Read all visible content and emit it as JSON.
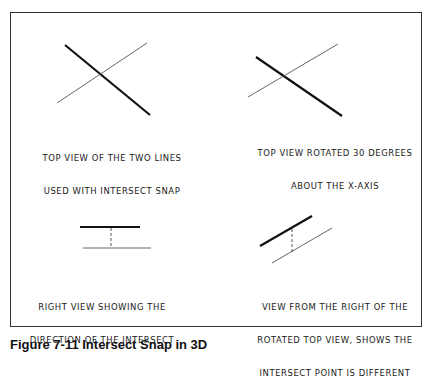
{
  "figure": {
    "caption": "Figure 7-11 Intersect Snap in 3D",
    "panels": [
      {
        "id": "top-view",
        "label_lines": [
          "TOP VIEW OF THE TWO LINES",
          "USED WITH INTERSECT SNAP"
        ],
        "thick_line": [
          65,
          45,
          150,
          115
        ],
        "thin_line": [
          57,
          103,
          147,
          43
        ]
      },
      {
        "id": "rotated-top-view",
        "label_lines": [
          "TOP VIEW ROTATED 30 DEGREES",
          "ABOUT THE X-AXIS"
        ],
        "thick_line": [
          256,
          57,
          342,
          116
        ],
        "thin_line": [
          248,
          97,
          338,
          44
        ]
      },
      {
        "id": "right-view",
        "label_lines": [
          "RIGHT VIEW SHOWING THE",
          "DIRECTION OF THE INTERSECT"
        ],
        "thick_line": [
          80,
          227,
          140,
          227
        ],
        "thin_line": [
          83,
          248,
          151,
          248
        ],
        "dashed_line": [
          111,
          227,
          111,
          246
        ]
      },
      {
        "id": "rotated-right-view",
        "label_lines": [
          "VIEW FROM THE RIGHT OF THE",
          "ROTATED TOP VIEW, SHOWS THE",
          "INTERSECT POINT IS DIFFERENT"
        ],
        "thick_line": [
          260,
          246,
          312,
          216
        ],
        "thin_line": [
          272,
          263,
          332,
          228
        ],
        "dashed_line": [
          292,
          228,
          292,
          252
        ]
      }
    ]
  },
  "colors": {
    "thick": "#111111",
    "thin": "#555555",
    "frame": "#333333"
  }
}
